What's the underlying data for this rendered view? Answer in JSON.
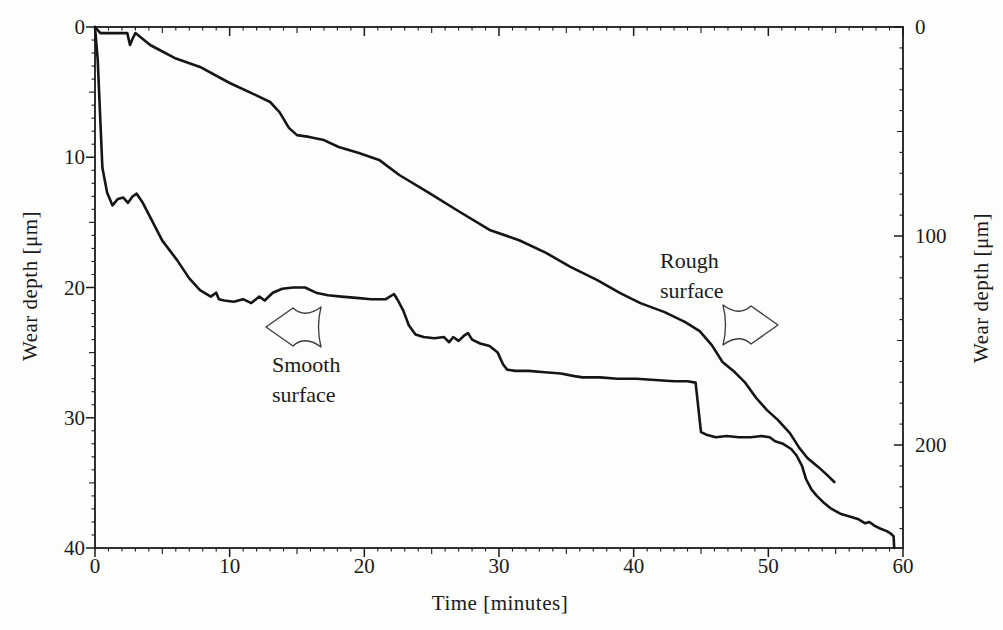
{
  "figure": {
    "background": "#fdfdfb",
    "ink_color": "#1a1a1a"
  },
  "chart_data": {
    "type": "line",
    "title": "",
    "xlabel": "Time [minutes]",
    "ylabel_left": "Wear depth [μm]",
    "ylabel_right": "Wear depth [μm]",
    "x_axis": {
      "min": 0,
      "max": 60,
      "major_ticks": [
        0,
        10,
        20,
        30,
        40,
        50,
        60
      ],
      "medium_step": 5,
      "minor_step": 1
    },
    "y_axis_left": {
      "min": 0,
      "max": 40,
      "inverted": true,
      "major_ticks": [
        0,
        10,
        20,
        30,
        40
      ],
      "medium_step": 5,
      "minor_step": 1
    },
    "y_axis_right": {
      "min": 0,
      "max": 249,
      "inverted": true,
      "major_ticks": [
        0,
        100,
        200
      ],
      "medium_step": 50,
      "minor_step": 10
    },
    "grid": false,
    "frame": "full box with ticks on all four sides",
    "series": [
      {
        "name": "Smooth surface",
        "y_axis": "left",
        "points": [
          [
            0,
            0
          ],
          [
            0.2,
            2.5
          ],
          [
            0.55,
            10.8
          ],
          [
            0.9,
            12.7
          ],
          [
            1.3,
            13.7
          ],
          [
            1.7,
            13.2
          ],
          [
            2.1,
            13.1
          ],
          [
            2.45,
            13.5
          ],
          [
            2.8,
            13.0
          ],
          [
            3.1,
            12.8
          ],
          [
            3.55,
            13.5
          ],
          [
            4.2,
            14.8
          ],
          [
            5.0,
            16.4
          ],
          [
            6.1,
            17.9
          ],
          [
            7.0,
            19.3
          ],
          [
            7.8,
            20.2
          ],
          [
            8.6,
            20.7
          ],
          [
            9.0,
            20.4
          ],
          [
            9.2,
            20.9
          ],
          [
            9.6,
            21.0
          ],
          [
            10.3,
            21.1
          ],
          [
            11.0,
            20.9
          ],
          [
            11.6,
            21.2
          ],
          [
            12.2,
            20.7
          ],
          [
            12.6,
            21.0
          ],
          [
            13.2,
            20.4
          ],
          [
            13.9,
            20.1
          ],
          [
            14.7,
            20.0
          ],
          [
            15.6,
            20.0
          ],
          [
            16.4,
            20.4
          ],
          [
            17.3,
            20.6
          ],
          [
            18.3,
            20.7
          ],
          [
            19.4,
            20.8
          ],
          [
            20.5,
            20.9
          ],
          [
            21.6,
            20.9
          ],
          [
            22.2,
            20.5
          ],
          [
            22.5,
            21.0
          ],
          [
            22.9,
            21.8
          ],
          [
            23.3,
            22.9
          ],
          [
            23.8,
            23.6
          ],
          [
            24.4,
            23.8
          ],
          [
            25.2,
            23.9
          ],
          [
            25.9,
            23.8
          ],
          [
            26.3,
            24.2
          ],
          [
            26.6,
            23.8
          ],
          [
            27.0,
            24.1
          ],
          [
            27.4,
            23.7
          ],
          [
            27.7,
            23.5
          ],
          [
            28.0,
            24.0
          ],
          [
            28.6,
            24.3
          ],
          [
            29.3,
            24.5
          ],
          [
            29.9,
            25.0
          ],
          [
            30.3,
            25.9
          ],
          [
            30.6,
            26.3
          ],
          [
            31.2,
            26.4
          ],
          [
            32.2,
            26.4
          ],
          [
            33.4,
            26.5
          ],
          [
            34.6,
            26.6
          ],
          [
            35.6,
            26.8
          ],
          [
            36.2,
            26.9
          ],
          [
            37.5,
            26.9
          ],
          [
            38.8,
            27.0
          ],
          [
            40.2,
            27.0
          ],
          [
            41.6,
            27.1
          ],
          [
            43.0,
            27.2
          ],
          [
            44.0,
            27.2
          ],
          [
            44.6,
            27.3
          ],
          [
            44.8,
            29.2
          ],
          [
            45.0,
            31.1
          ],
          [
            45.4,
            31.3
          ],
          [
            46.1,
            31.5
          ],
          [
            46.9,
            31.4
          ],
          [
            47.8,
            31.5
          ],
          [
            48.7,
            31.5
          ],
          [
            49.5,
            31.4
          ],
          [
            50.1,
            31.5
          ],
          [
            50.5,
            31.8
          ],
          [
            51.1,
            32.0
          ],
          [
            51.7,
            32.4
          ],
          [
            52.1,
            32.9
          ],
          [
            52.5,
            33.7
          ],
          [
            52.8,
            34.7
          ],
          [
            53.2,
            35.5
          ],
          [
            53.6,
            36.0
          ],
          [
            54.1,
            36.5
          ],
          [
            54.7,
            37.0
          ],
          [
            55.4,
            37.4
          ],
          [
            56.1,
            37.6
          ],
          [
            56.7,
            37.8
          ],
          [
            57.2,
            38.1
          ],
          [
            57.5,
            38.0
          ],
          [
            57.9,
            38.3
          ],
          [
            58.3,
            38.5
          ],
          [
            58.8,
            38.7
          ],
          [
            59.1,
            38.9
          ],
          [
            59.3,
            39.1
          ],
          [
            59.35,
            40.0
          ]
        ]
      },
      {
        "name": "Rough surface",
        "y_axis": "right",
        "points": [
          [
            0,
            0
          ],
          [
            0.4,
            2.9
          ],
          [
            2.4,
            2.9
          ],
          [
            2.6,
            8.6
          ],
          [
            2.75,
            6.2
          ],
          [
            3.0,
            2.9
          ],
          [
            4.1,
            8.6
          ],
          [
            4.8,
            11.0
          ],
          [
            5.9,
            14.8
          ],
          [
            7.8,
            19.1
          ],
          [
            10.0,
            26.8
          ],
          [
            11.9,
            32.5
          ],
          [
            13.0,
            35.9
          ],
          [
            13.7,
            40.7
          ],
          [
            14.4,
            48.3
          ],
          [
            15.0,
            51.7
          ],
          [
            15.9,
            52.6
          ],
          [
            17.0,
            54.1
          ],
          [
            18.1,
            57.4
          ],
          [
            19.6,
            60.3
          ],
          [
            21.1,
            63.6
          ],
          [
            22.6,
            70.8
          ],
          [
            24.8,
            79.4
          ],
          [
            27.1,
            88.5
          ],
          [
            29.3,
            97.1
          ],
          [
            31.5,
            102.0
          ],
          [
            33.5,
            108.1
          ],
          [
            35.3,
            114.8
          ],
          [
            37.3,
            121.1
          ],
          [
            39.0,
            127.3
          ],
          [
            40.5,
            132.1
          ],
          [
            42.3,
            136.4
          ],
          [
            43.8,
            141.1
          ],
          [
            44.9,
            145.5
          ],
          [
            45.8,
            152.2
          ],
          [
            46.6,
            160.3
          ],
          [
            47.5,
            165.1
          ],
          [
            48.3,
            170.3
          ],
          [
            49.1,
            177.5
          ],
          [
            49.9,
            183.3
          ],
          [
            50.7,
            188.0
          ],
          [
            51.6,
            194.3
          ],
          [
            52.3,
            201.4
          ],
          [
            52.9,
            206.2
          ],
          [
            53.7,
            210.5
          ],
          [
            54.3,
            213.9
          ],
          [
            54.9,
            217.7
          ]
        ]
      }
    ],
    "annotations": [
      {
        "label": "Smooth\nsurface",
        "arrow_direction": "left",
        "refers_to": "Smooth surface"
      },
      {
        "label": "Rough\nsurface",
        "arrow_direction": "right",
        "refers_to": "Rough surface"
      }
    ]
  }
}
